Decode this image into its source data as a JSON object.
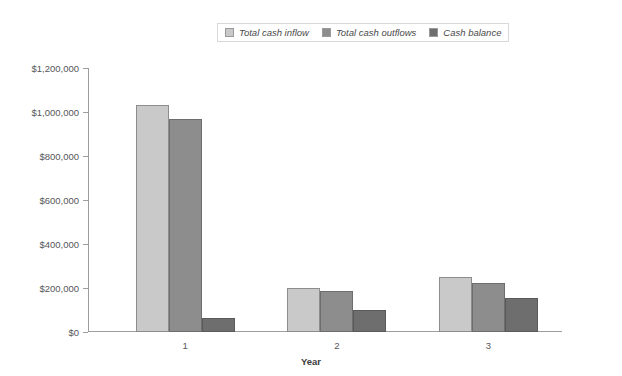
{
  "chart_data": {
    "type": "bar",
    "title": "",
    "xlabel": "Year",
    "ylabel": "",
    "categories": [
      "1",
      "2",
      "3"
    ],
    "series": [
      {
        "name": "Total cash inflow",
        "values": [
          1030000,
          200000,
          250000
        ],
        "color": "#c9c9c9"
      },
      {
        "name": "Total cash outflows",
        "values": [
          970000,
          185000,
          225000
        ],
        "color": "#8d8d8d"
      },
      {
        "name": "Cash balance",
        "values": [
          65000,
          100000,
          155000
        ],
        "color": "#6e6e6e"
      }
    ],
    "ylim": [
      0,
      1200000
    ],
    "ytick_values": [
      0,
      200000,
      400000,
      600000,
      800000,
      1000000,
      1200000
    ],
    "ytick_labels": [
      "$0",
      "$200,000",
      "$400,000",
      "$600,000",
      "$800,000",
      "$1,000,000",
      "$1,200,000"
    ],
    "grid": false,
    "legend_position": "top-center",
    "background": "#ffffff"
  },
  "legend": {
    "entries": [
      {
        "label": "Total cash inflow"
      },
      {
        "label": "Total cash outflows"
      },
      {
        "label": "Cash balance"
      }
    ]
  },
  "axes": {
    "x_title": "Year",
    "x_labels": [
      "1",
      "2",
      "3"
    ],
    "y_labels": [
      "$1,200,000",
      "$1,000,000",
      "$800,000",
      "$600,000",
      "$400,000",
      "$200,000",
      "$0"
    ]
  }
}
